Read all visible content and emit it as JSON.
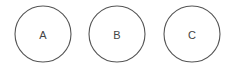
{
  "diagram": {
    "nodes": [
      {
        "id": "A",
        "label": "A",
        "cx": 43,
        "cy": 34,
        "r": 28
      },
      {
        "id": "B",
        "label": "B",
        "cx": 117,
        "cy": 34,
        "r": 28
      },
      {
        "id": "C",
        "label": "C",
        "cx": 192,
        "cy": 34,
        "r": 28
      }
    ],
    "stroke_color": "#555555",
    "text_color": "#444444"
  }
}
